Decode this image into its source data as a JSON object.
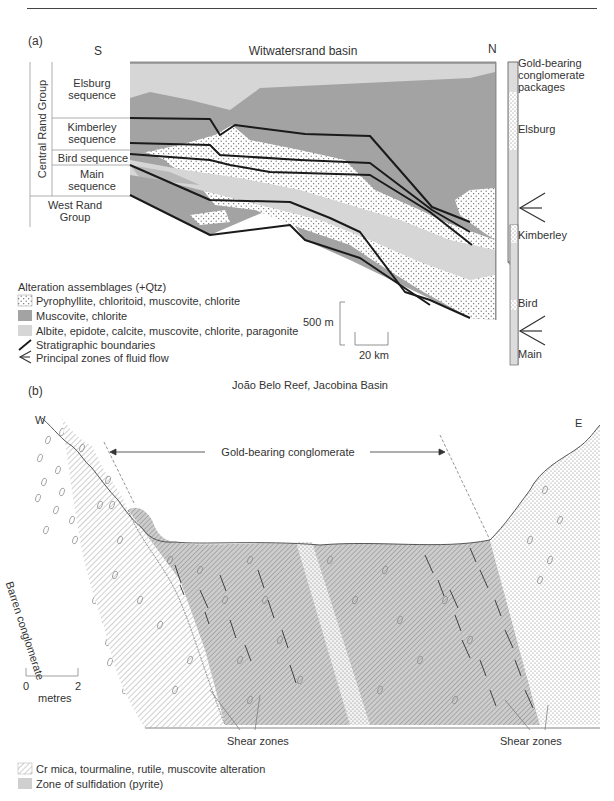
{
  "page_header": {
    "text": ""
  },
  "panel_a": {
    "label": "(a)",
    "title": "Witwatersrand basin",
    "direction_left": "S",
    "direction_right": "N",
    "stratigraphy": {
      "group_central": "Central Rand Group",
      "sequences": [
        {
          "name_line1": "Elsburg",
          "name_line2": "sequence"
        },
        {
          "name_line1": "Kimberley",
          "name_line2": "sequence"
        },
        {
          "name_line1": "Bird sequence",
          "name_line2": ""
        },
        {
          "name_line1": "Main",
          "name_line2": "sequence"
        }
      ],
      "group_west_line1": "West Rand",
      "group_west_line2": "Group"
    },
    "column": {
      "title_line1": "Gold-bearing",
      "title_line2": "conglomerate",
      "title_line3": "packages",
      "packages": [
        "Elsburg",
        "Kimberley",
        "Bird",
        "Main"
      ]
    },
    "legend": {
      "title": "Alteration assemblages (+Qtz)",
      "items": [
        {
          "pattern": "stipple",
          "label": "Pyrophyllite, chloritoid, muscovite, chlorite"
        },
        {
          "pattern": "dark-grey",
          "color": "#a3a3a3",
          "label": "Muscovite, chlorite"
        },
        {
          "pattern": "light-grey",
          "color": "#d6d6d6",
          "label": "Albite, epidote, calcite, muscovite, chlorite, paragonite"
        },
        {
          "pattern": "line",
          "label": "Stratigraphic boundaries"
        },
        {
          "pattern": "arrow",
          "label": "Principal zones of fluid flow"
        }
      ]
    },
    "scale": {
      "vertical": "500 m",
      "horizontal": "20 km"
    }
  },
  "panel_b": {
    "label": "(b)",
    "title": "João Belo Reef, Jacobina Basin",
    "direction_left": "W",
    "direction_right": "E",
    "annotation": "Gold-bearing conglomerate",
    "side_label": "Barren conglomerate",
    "shear_zones_left": "Shear zones",
    "shear_zones_right": "Shear zones",
    "scale": {
      "start": "0",
      "end": "2",
      "unit": "metres"
    },
    "legend": {
      "items": [
        {
          "pattern": "hatch",
          "label": "Cr mica, tourmaline, rutile, muscovite alteration"
        },
        {
          "pattern": "grey",
          "color": "#cfcfcf",
          "label": "Zone of sulfidation (pyrite)"
        }
      ]
    }
  },
  "colors": {
    "dark_grey": "#a3a3a3",
    "light_grey": "#d6d6d6",
    "boundary": "#1a1a1a"
  }
}
